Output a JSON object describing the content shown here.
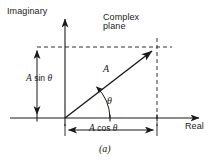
{
  "figure": {
    "caption": "(a)",
    "axes": {
      "y_label": "Imaginary",
      "x_label": "Real"
    },
    "annotations": {
      "plane_line1": "Complex",
      "plane_line2": "plane",
      "vector_label": "A",
      "angle_label": "θ",
      "imag_component_magnitude": "A",
      "imag_component_function": "sin",
      "imag_component_angle": "θ",
      "real_component_magnitude": "A",
      "real_component_function": "cos",
      "real_component_angle": "θ"
    },
    "geometry": {
      "origin_x": 65,
      "origin_y": 118,
      "tip_x": 157,
      "tip_y": 47,
      "x_axis_start": 10,
      "x_axis_end": 205,
      "y_axis_top": 13,
      "y_axis_bottom": 126,
      "asin_arrow_x": 37,
      "acos_arrow_y": 130
    },
    "colors": {
      "stroke": "#1a1a1a",
      "background": "#ffffff"
    }
  }
}
